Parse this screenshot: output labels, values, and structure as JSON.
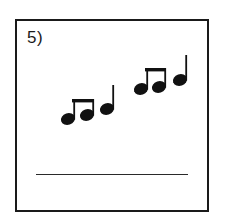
{
  "page": {
    "background_color": "#ffffff",
    "width": 225,
    "height": 220
  },
  "question": {
    "number_label": "5)",
    "border_color": "#1a1a1a",
    "ink_color": "#111111",
    "answer_line": {
      "present": true,
      "value": "",
      "color": "#2a2a2a"
    }
  },
  "notation": {
    "description": "Two rhythm groups of beamed eighth-note pairs each followed by a quarter note, ascending",
    "stem_direction": "up",
    "groups": [
      {
        "group_index": 1,
        "notes": [
          {
            "index": 1,
            "type": "eighth",
            "beamed": true,
            "head_cx": 51,
            "head_cy": 98,
            "stem_x": 57.2,
            "stem_top": 78
          },
          {
            "index": 2,
            "type": "eighth",
            "beamed": true,
            "head_cx": 70,
            "head_cy": 94,
            "stem_x": 76.2,
            "stem_top": 78
          },
          {
            "index": 3,
            "type": "quarter",
            "beamed": false,
            "head_cx": 90,
            "head_cy": 88,
            "stem_x": 96.2,
            "stem_top": 64
          }
        ],
        "beam": {
          "x1": 55,
          "x2": 77,
          "y": 78,
          "thickness": 3.4
        }
      },
      {
        "group_index": 2,
        "notes": [
          {
            "index": 4,
            "type": "eighth",
            "beamed": true,
            "head_cx": 124,
            "head_cy": 68,
            "stem_x": 130.2,
            "stem_top": 47
          },
          {
            "index": 5,
            "type": "eighth",
            "beamed": true,
            "head_cx": 142,
            "head_cy": 66,
            "stem_x": 148.2,
            "stem_top": 47
          },
          {
            "index": 6,
            "type": "quarter",
            "beamed": false,
            "head_cx": 163,
            "head_cy": 59,
            "stem_x": 169.2,
            "stem_top": 34
          }
        ],
        "beam": {
          "x1": 128,
          "x2": 149,
          "y": 47,
          "thickness": 3.4
        }
      }
    ],
    "note_head": {
      "rx": 7.2,
      "ry": 5.8,
      "rotation": -18
    },
    "stem_width": 1.8
  }
}
